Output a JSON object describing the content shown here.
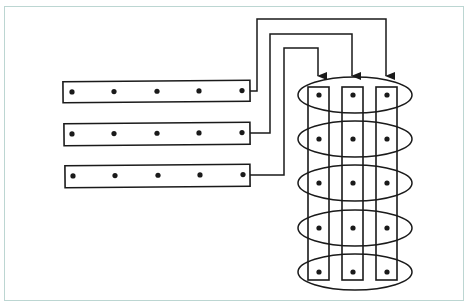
{
  "diagram": {
    "colors": {
      "stroke": "#1a1a1a",
      "frame": "#bcd6d2",
      "background": "#ffffff"
    },
    "bars": [
      {
        "id": "bar-1",
        "x": 63,
        "y": 81,
        "w": 187,
        "h": 21,
        "dots_x": [
          72,
          114,
          157,
          199,
          242
        ],
        "dot_y": 92,
        "exit_y": 91
      },
      {
        "id": "bar-2",
        "x": 64,
        "y": 123,
        "w": 186,
        "h": 22,
        "dots_x": [
          72,
          114,
          157,
          199,
          242
        ],
        "dot_y": 134,
        "exit_y": 133
      },
      {
        "id": "bar-3",
        "x": 65,
        "y": 165,
        "w": 185,
        "h": 22,
        "dots_x": [
          73,
          115,
          158,
          200,
          243
        ],
        "dot_y": 176,
        "exit_y": 175
      }
    ],
    "wires": [
      {
        "from": "bar-1",
        "to": "column-3",
        "vx": 257,
        "top_y": 19,
        "target_x": 386
      },
      {
        "from": "bar-2",
        "to": "column-2",
        "vx": 270,
        "top_y": 34,
        "target_x": 352
      },
      {
        "from": "bar-3",
        "to": "column-1",
        "vx": 284,
        "top_y": 48,
        "target_x": 318
      }
    ],
    "arrow_tip_y": 77,
    "columns": [
      {
        "id": "column-1",
        "x": 308,
        "w": 21,
        "top": 87,
        "bottom": 280,
        "dot_x": 319
      },
      {
        "id": "column-2",
        "x": 342,
        "w": 21,
        "top": 87,
        "bottom": 280,
        "dot_x": 353
      },
      {
        "id": "column-3",
        "x": 376,
        "w": 21,
        "top": 87,
        "bottom": 280,
        "dot_x": 387
      }
    ],
    "ellipses": [
      {
        "id": "ellipse-1",
        "cx": 355,
        "cy": 95,
        "rx": 57,
        "ry": 18
      },
      {
        "id": "ellipse-2",
        "cx": 355,
        "cy": 139,
        "rx": 57,
        "ry": 18
      },
      {
        "id": "ellipse-3",
        "cx": 355,
        "cy": 183,
        "rx": 57,
        "ry": 18
      },
      {
        "id": "ellipse-4",
        "cx": 355,
        "cy": 228,
        "rx": 57,
        "ry": 18
      },
      {
        "id": "ellipse-5",
        "cx": 355,
        "cy": 272,
        "rx": 57,
        "ry": 18
      }
    ],
    "dot_radius": 2.6
  }
}
